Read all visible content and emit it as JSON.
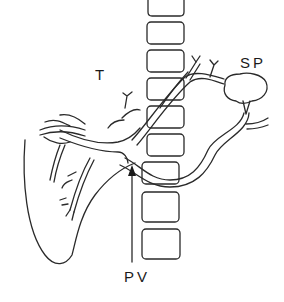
{
  "diagram": {
    "type": "anatomical line drawing",
    "labels": {
      "liver": "T",
      "spleen": "SP",
      "portal_vein": "PV"
    },
    "colors": {
      "stroke": "#2a2a2a",
      "background": "#ffffff"
    }
  }
}
